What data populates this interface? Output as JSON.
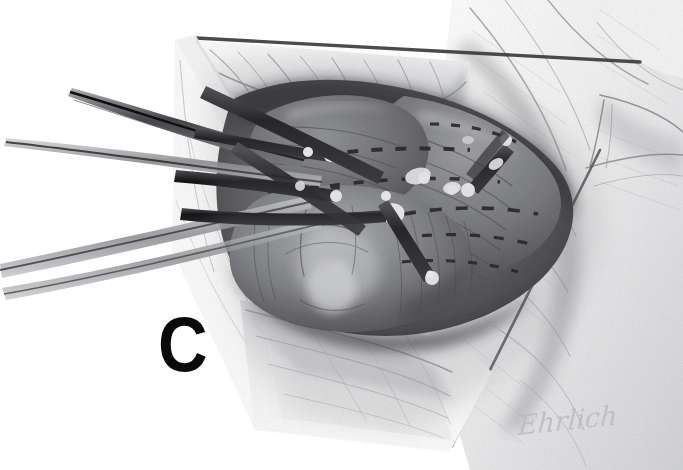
{
  "figure": {
    "kind": "medical-illustration",
    "medium": "graphite pencil drawing",
    "background_color": "#ffffff",
    "width": 683,
    "height": 470
  },
  "panel": {
    "label": "C"
  },
  "signature": {
    "text": "Ehrlich",
    "color": "#b9bcc2"
  },
  "palette": {
    "paper": "#ffffff",
    "light_tissue": "#e9e9ea",
    "mid_tissue": "#b0b1b3",
    "dark_tissue": "#5e5f62",
    "deep_shadow": "#2b2c2f",
    "instrument": "#1a1a1c",
    "highlight": "#fbfbfb",
    "outline": "#4a4b4e"
  },
  "annotations": {
    "incision_outline": "dark V-shaped wound margin",
    "dashed_marks": "dashed surgical planning lines on muscle surface",
    "instrument_tips": "white specular highlights at instrument tips"
  }
}
